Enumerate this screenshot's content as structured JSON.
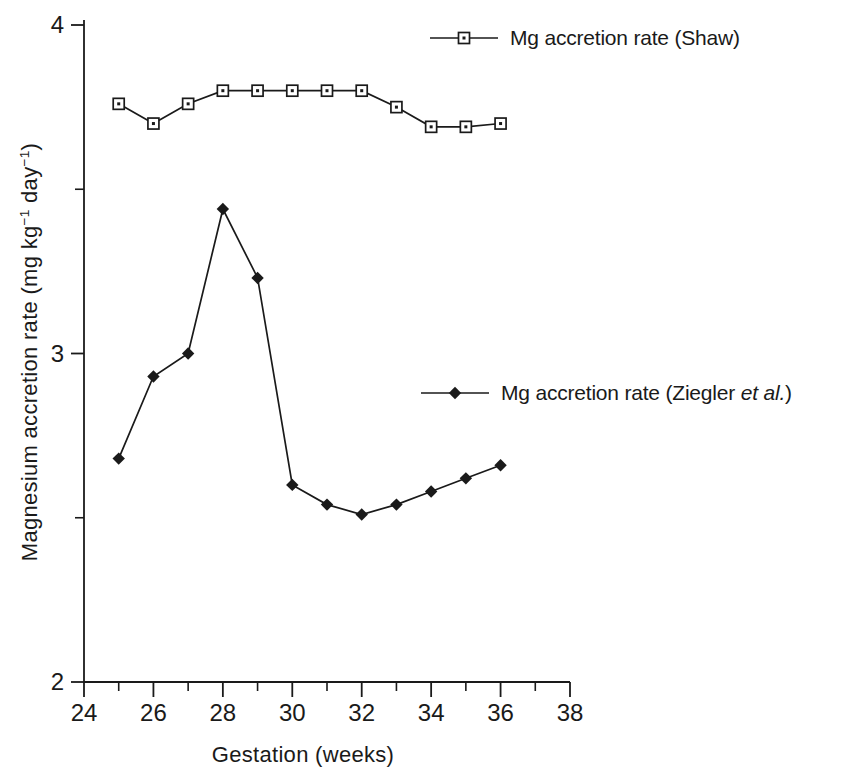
{
  "figure": {
    "background": "#ffffff",
    "ink_color": "#1a1a1a"
  },
  "chart_data": {
    "type": "line",
    "x": [
      25,
      26,
      27,
      28,
      29,
      30,
      31,
      32,
      33,
      34,
      35,
      36
    ],
    "series": [
      {
        "name": "Mg accretion rate (Shaw)",
        "marker": "open-square-with-dot",
        "values": [
          3.76,
          3.7,
          3.76,
          3.8,
          3.8,
          3.8,
          3.8,
          3.8,
          3.75,
          3.69,
          3.69,
          3.7
        ]
      },
      {
        "name": "Mg accretion rate (Ziegler et al.)",
        "marker": "filled-diamond",
        "values": [
          2.68,
          2.93,
          3.0,
          3.44,
          3.23,
          2.6,
          2.54,
          2.51,
          2.54,
          2.58,
          2.62,
          2.66
        ]
      }
    ],
    "title": "",
    "xlabel": "Gestation (weeks)",
    "ylabel": "Magnesium accretion rate (mg kg−1 day−1)",
    "xlim": [
      24,
      38
    ],
    "ylim": [
      2,
      4
    ],
    "x_major_ticks": [
      24,
      26,
      28,
      30,
      32,
      34,
      36,
      38
    ],
    "x_minor_ticks": [
      25,
      27,
      29,
      31,
      33,
      35,
      37
    ],
    "y_major_ticks": [
      2,
      3,
      4
    ],
    "y_minor_ticks": [
      2.5,
      3.5
    ],
    "grid": false,
    "legend_position": "inside-right",
    "line_color": "#1a1a1a"
  },
  "labels": {
    "x_title": "Gestation (weeks)",
    "y_title_pre": "Magnesium accretion rate (mg kg",
    "y_title_sup1": "−1",
    "y_title_mid": " day",
    "y_title_sup2": "−1",
    "y_title_post": ")",
    "legend_shaw": "Mg accretion rate (Shaw)",
    "legend_ziegler_pre": "Mg accretion rate (Ziegler ",
    "legend_ziegler_em": "et al.",
    "legend_ziegler_post": ")"
  }
}
